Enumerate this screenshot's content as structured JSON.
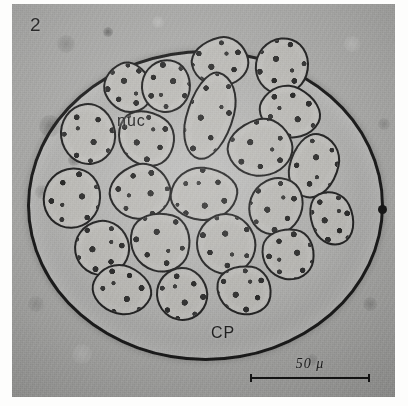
{
  "figure": {
    "number": "2",
    "caption_labels": {
      "nucleus": "nuc",
      "cytoplasm": "CP"
    },
    "scale_bar": {
      "label": "50 μ",
      "value": 50,
      "unit": "μ",
      "length_px": 120
    }
  },
  "image": {
    "type": "light-micrograph",
    "subject": "multinucleate cyst containing granular cells",
    "background_color": "#a9a9a7",
    "wall_color": "#181818",
    "cell_fill_color": "#b9b8b4",
    "label_color": "#1a1a1a"
  },
  "structures": {
    "cyst_wall": {
      "shape": "ellipse",
      "center_x": 203,
      "center_y": 202,
      "radius_x": 176,
      "radius_y": 153
    },
    "wall_nodule": {
      "x": 377,
      "y": 203
    }
  },
  "cells": [
    {
      "x": 206,
      "y": 56,
      "w": 54,
      "h": 46,
      "rot": -12,
      "shape": "lobed"
    },
    {
      "x": 268,
      "y": 60,
      "w": 50,
      "h": 54,
      "rot": 18,
      "shape": "round"
    },
    {
      "x": 114,
      "y": 82,
      "w": 44,
      "h": 48,
      "rot": -24,
      "shape": "lobed"
    },
    {
      "x": 152,
      "y": 80,
      "w": 46,
      "h": 50,
      "rot": 8,
      "shape": "round"
    },
    {
      "x": 276,
      "y": 106,
      "w": 58,
      "h": 48,
      "rot": 28,
      "shape": "elong"
    },
    {
      "x": 74,
      "y": 128,
      "w": 52,
      "h": 58,
      "rot": -8,
      "shape": "round"
    },
    {
      "x": 132,
      "y": 132,
      "w": 56,
      "h": 50,
      "rot": 34,
      "shape": "lobed"
    },
    {
      "x": 196,
      "y": 110,
      "w": 44,
      "h": 86,
      "rot": 14,
      "shape": "elong"
    },
    {
      "x": 246,
      "y": 142,
      "w": 62,
      "h": 54,
      "rot": -16,
      "shape": "lobed"
    },
    {
      "x": 300,
      "y": 160,
      "w": 46,
      "h": 62,
      "rot": 12,
      "shape": "elong"
    },
    {
      "x": 58,
      "y": 192,
      "w": 54,
      "h": 58,
      "rot": 22,
      "shape": "round"
    },
    {
      "x": 126,
      "y": 186,
      "w": 58,
      "h": 52,
      "rot": -18,
      "shape": "lobed"
    },
    {
      "x": 190,
      "y": 188,
      "w": 64,
      "h": 50,
      "rot": 6,
      "shape": "elong"
    },
    {
      "x": 262,
      "y": 200,
      "w": 50,
      "h": 56,
      "rot": 30,
      "shape": "round"
    },
    {
      "x": 88,
      "y": 242,
      "w": 52,
      "h": 52,
      "rot": -10,
      "shape": "round"
    },
    {
      "x": 146,
      "y": 236,
      "w": 58,
      "h": 56,
      "rot": 16,
      "shape": "lobed"
    },
    {
      "x": 212,
      "y": 238,
      "w": 56,
      "h": 58,
      "rot": -22,
      "shape": "round"
    },
    {
      "x": 274,
      "y": 248,
      "w": 50,
      "h": 48,
      "rot": 10,
      "shape": "lobed"
    },
    {
      "x": 108,
      "y": 284,
      "w": 56,
      "h": 46,
      "rot": 24,
      "shape": "elong"
    },
    {
      "x": 168,
      "y": 288,
      "w": 48,
      "h": 50,
      "rot": -14,
      "shape": "round"
    },
    {
      "x": 230,
      "y": 284,
      "w": 52,
      "h": 46,
      "rot": 8,
      "shape": "lobed"
    },
    {
      "x": 318,
      "y": 212,
      "w": 40,
      "h": 52,
      "rot": -26,
      "shape": "elong"
    }
  ],
  "blotches": [
    {
      "x": 38,
      "y": 122,
      "r": 11,
      "tone": "dark",
      "alpha": 0.26
    },
    {
      "x": 62,
      "y": 156,
      "r": 6,
      "tone": "dark",
      "alpha": 0.38
    },
    {
      "x": 30,
      "y": 188,
      "r": 7,
      "tone": "dark",
      "alpha": 0.22
    },
    {
      "x": 54,
      "y": 40,
      "r": 9,
      "tone": "dark",
      "alpha": 0.18
    },
    {
      "x": 96,
      "y": 28,
      "r": 5,
      "tone": "dark",
      "alpha": 0.42
    },
    {
      "x": 146,
      "y": 18,
      "r": 6,
      "tone": "light",
      "alpha": 0.22
    },
    {
      "x": 340,
      "y": 40,
      "r": 8,
      "tone": "light",
      "alpha": 0.2
    },
    {
      "x": 358,
      "y": 300,
      "r": 7,
      "tone": "dark",
      "alpha": 0.2
    },
    {
      "x": 300,
      "y": 356,
      "r": 6,
      "tone": "dark",
      "alpha": 0.16
    },
    {
      "x": 70,
      "y": 350,
      "r": 10,
      "tone": "light",
      "alpha": 0.18
    },
    {
      "x": 24,
      "y": 300,
      "r": 8,
      "tone": "dark",
      "alpha": 0.14
    },
    {
      "x": 372,
      "y": 120,
      "r": 6,
      "tone": "dark",
      "alpha": 0.18
    }
  ]
}
